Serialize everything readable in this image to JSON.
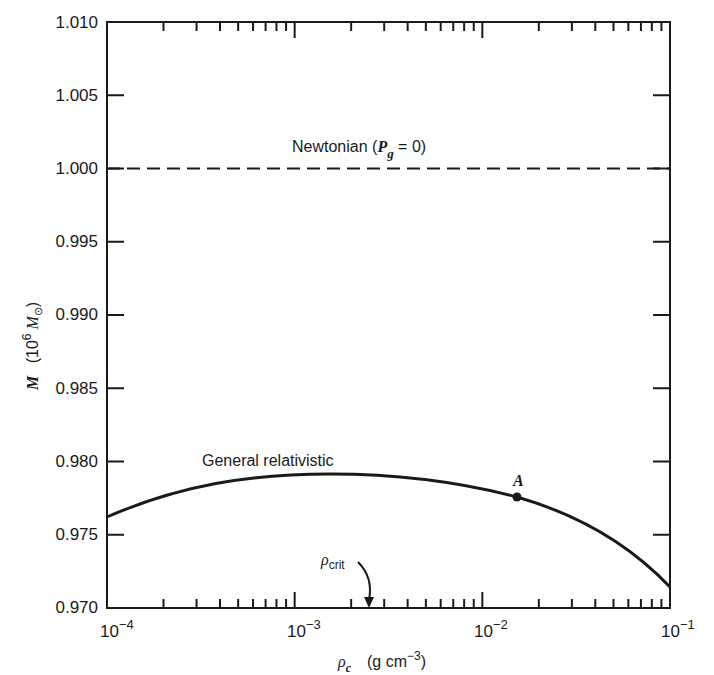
{
  "chart_data": {
    "type": "line",
    "title": "",
    "xlabel": "ρ_c (g cm^-3)",
    "ylabel": "M (10^6 M_⊙)",
    "xscale": "log",
    "xlim": [
      0.0001,
      0.1
    ],
    "ylim": [
      0.97,
      1.01
    ],
    "grid": false,
    "legend": "none (inline labels)",
    "x_ticks": [
      "10^-4",
      "10^-3",
      "10^-2",
      "10^-1"
    ],
    "y_ticks": [
      "0.970",
      "0.975",
      "0.980",
      "0.985",
      "0.990",
      "0.995",
      "1.000",
      "1.005",
      "1.010"
    ],
    "series": [
      {
        "name": "Newtonian (P_g = 0)",
        "style": "dashed",
        "x": [
          0.0001,
          0.1
        ],
        "y": [
          1.0,
          1.0
        ]
      },
      {
        "name": "General relativistic",
        "style": "solid",
        "x": [
          0.0001,
          0.0002,
          0.0005,
          0.001,
          0.0025,
          0.005,
          0.01,
          0.015,
          0.02,
          0.05,
          0.1
        ],
        "y": [
          0.9762,
          0.9772,
          0.9783,
          0.9789,
          0.9791,
          0.9788,
          0.9781,
          0.9776,
          0.977,
          0.9747,
          0.9714
        ]
      }
    ],
    "annotations": [
      {
        "text": "Newtonian (P_g = 0)",
        "x": 0.0025,
        "y": 1.0012
      },
      {
        "text": "General relativistic",
        "x": 0.0008,
        "y": 0.9802
      },
      {
        "text": "A",
        "type": "point",
        "x": 0.015,
        "y": 0.9776
      },
      {
        "text": "ρ_crit",
        "type": "arrow",
        "x": 0.0025,
        "y": 0.97
      }
    ]
  },
  "labels": {
    "y_ticks": [
      "0.970",
      "0.975",
      "0.980",
      "0.985",
      "0.990",
      "0.995",
      "1.000",
      "1.005",
      "1.010"
    ],
    "x_base": "10",
    "x_exps": [
      "−4",
      "−3",
      "−2",
      "−1"
    ],
    "ylabel_M": "M",
    "ylabel_unit_pre": "(10",
    "ylabel_unit_exp": "6",
    "ylabel_unit_M": "M",
    "ylabel_unit_sun": "⊙",
    "ylabel_unit_post": ")",
    "xlabel_rho": "ρ",
    "xlabel_sub": "c",
    "xlabel_unit_pre": "(g cm",
    "xlabel_unit_exp": "−3",
    "xlabel_unit_post": ")",
    "newtonian_pre": "Newtonian (",
    "newtonian_P": "P",
    "newtonian_sub": "g",
    "newtonian_post": " = 0)",
    "gr_label": "General relativistic",
    "point_A": "A",
    "rho_crit": "ρ",
    "rho_crit_sub": "crit"
  }
}
